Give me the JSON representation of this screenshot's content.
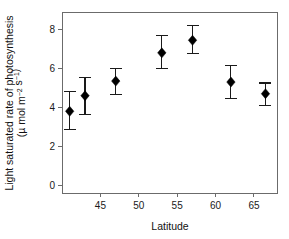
{
  "chart_data": {
    "type": "scatter",
    "title": "",
    "xlabel": "Latitude",
    "ylabel_line1": "Light saturated rate of photosynthesis",
    "ylabel_line2_prefix": "(",
    "ylabel_line2_mu": "µ",
    "ylabel_line2_mid": " mol m",
    "ylabel_line2_sup1": "−2",
    "ylabel_line2_mid2": " s",
    "ylabel_line2_sup2": "−1",
    "ylabel_line2_suffix": ")",
    "ylabel_full": "Light saturated rate of photosynthesis (µ mol m−2 s−1)",
    "x": [
      41,
      43,
      47,
      53,
      57,
      62,
      66.5
    ],
    "values": [
      3.8,
      4.6,
      5.35,
      6.8,
      7.45,
      5.3,
      4.7
    ],
    "err_upper": [
      4.8,
      5.55,
      6.0,
      7.7,
      8.2,
      6.15,
      5.25
    ],
    "err_lower": [
      2.85,
      3.65,
      4.65,
      6.0,
      6.75,
      4.45,
      4.1
    ],
    "xlim": [
      40,
      68
    ],
    "ylim": [
      -0.4,
      8.9
    ],
    "xticks": [
      45,
      50,
      55,
      60,
      65
    ],
    "xtick_labels": [
      "45",
      "50",
      "55",
      "60",
      "65"
    ],
    "yticks": [
      0,
      2,
      4,
      6,
      8
    ],
    "ytick_labels": [
      "0",
      "2",
      "4",
      "6",
      "8"
    ],
    "grid": false,
    "legend": "none",
    "marker": "filled-diamond",
    "marker_color": "#000000",
    "axis_color": "#6b6b6b",
    "series_name": "Light saturated photosynthesis rate"
  }
}
